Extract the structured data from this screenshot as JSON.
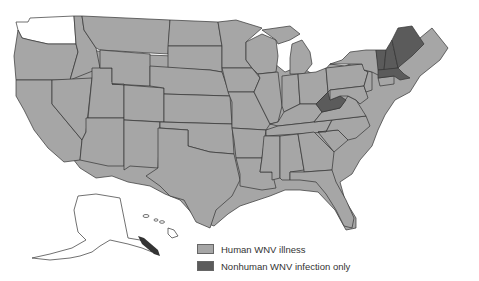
{
  "legend": {
    "items": [
      {
        "label": "Human WNV illness",
        "color": "#a6a6a6"
      },
      {
        "label": "Nonhuman WNV infection only",
        "color": "#5b5b5b"
      }
    ]
  },
  "colors": {
    "human": "#a6a6a6",
    "nonhuman": "#5b5b5b",
    "none": "#ffffff",
    "border": "#333333"
  },
  "states": {
    "no_data": [
      "WA",
      "AK",
      "HI"
    ],
    "nonhuman_only": [
      "ME",
      "NH",
      "VT",
      "MA",
      "WV"
    ],
    "human": "all other contiguous states"
  }
}
